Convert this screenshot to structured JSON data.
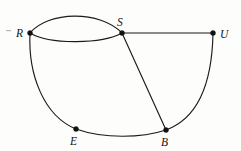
{
  "figure": {
    "background_color": "#fdfdfc",
    "ink_color": "#1b1b1b",
    "width": 241,
    "height": 151
  },
  "vertices": [
    {
      "id": "R",
      "label": "R",
      "x": 30,
      "y": 33,
      "label_x": 16,
      "label_y": 37
    },
    {
      "id": "S",
      "label": "S",
      "x": 122,
      "y": 33,
      "label_x": 117,
      "label_y": 26
    },
    {
      "id": "U",
      "label": "U",
      "x": 213,
      "y": 33,
      "label_x": 220,
      "label_y": 38
    },
    {
      "id": "E",
      "label": "E",
      "x": 76,
      "y": 129,
      "label_x": 70,
      "label_y": 145
    },
    {
      "id": "B",
      "label": "B",
      "x": 166,
      "y": 130,
      "label_x": 161,
      "label_y": 146
    }
  ],
  "edges": [
    {
      "id": "R-S-upper",
      "from": "R",
      "to": "S",
      "shape": "arc-up",
      "path": "M 30 33 C 48 11, 100 10, 122 33"
    },
    {
      "id": "R-S-lower",
      "from": "R",
      "to": "S",
      "shape": "arc-down",
      "path": "M 30 33 C 50 45, 102 44, 122 33"
    },
    {
      "id": "S-U",
      "from": "S",
      "to": "U",
      "shape": "straight",
      "path": "M 122 33 L 213 33"
    },
    {
      "id": "R-E",
      "from": "R",
      "to": "E",
      "shape": "arc-left",
      "path": "M 30 33 C 28 75, 44 116, 76 129"
    },
    {
      "id": "E-B",
      "from": "E",
      "to": "B",
      "shape": "arc-down",
      "path": "M 76 129 C 104 139, 142 138, 166 130"
    },
    {
      "id": "S-B",
      "from": "S",
      "to": "B",
      "shape": "straight",
      "path": "M 122 33 L 166 130"
    },
    {
      "id": "B-U",
      "from": "B",
      "to": "U",
      "shape": "arc-right",
      "path": "M 166 130 C 196 119, 212 86, 213 33"
    }
  ],
  "vertex_radius": 2.5,
  "artifacts": [
    {
      "id": "speck-left-of-R",
      "x": 6,
      "y": 30,
      "width": 5,
      "height": 1.2
    }
  ]
}
